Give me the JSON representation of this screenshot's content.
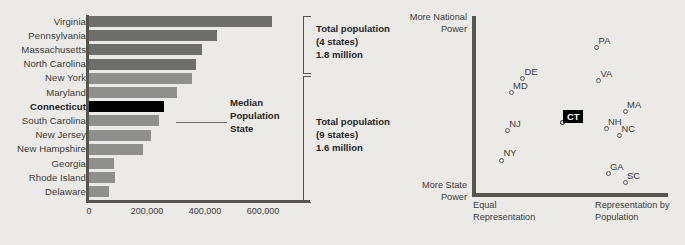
{
  "figure": {
    "background_color": "#eceae7",
    "bar_color_top": "#6e6e6c",
    "bar_color_bottom": "#8f8f8d",
    "highlight_color": "#000000",
    "axis_color": "#55544f"
  },
  "chart_data": [
    {
      "type": "bar",
      "orientation": "horizontal",
      "title": "",
      "xlabel": "",
      "ylabel": "",
      "xlim": [
        0,
        660000
      ],
      "grid": false,
      "categories": [
        "Virginia",
        "Pennsylvania",
        "Massachusetts",
        "North Carolina",
        "New York",
        "Maryland",
        "Connecticut",
        "South Carolina",
        "New Jersey",
        "New Hampshire",
        "Georgia",
        "Rhode Island",
        "Delaware"
      ],
      "values": [
        630000,
        440000,
        390000,
        370000,
        355000,
        305000,
        260000,
        240000,
        215000,
        185000,
        85000,
        88000,
        70000
      ],
      "group": [
        "top4",
        "top4",
        "top4",
        "top4",
        "bottom9",
        "bottom9",
        "bottom9",
        "bottom9",
        "bottom9",
        "bottom9",
        "bottom9",
        "bottom9",
        "bottom9"
      ],
      "highlight": "Connecticut",
      "tick_values": [
        0,
        200000,
        400000,
        600000
      ],
      "tick_labels": [
        "0",
        "200,000",
        "400,000",
        "600,000"
      ],
      "annotations": [
        {
          "name": "median-population-state",
          "lines": [
            "Median",
            "Population",
            "State"
          ],
          "points_to": "Connecticut"
        }
      ],
      "brackets": [
        {
          "name": "top-four-states",
          "covers": [
            "Virginia",
            "Pennsylvania",
            "Massachusetts",
            "North Carolina"
          ],
          "lines": [
            "Total population",
            "(4 states)",
            "1.8 million"
          ]
        },
        {
          "name": "bottom-nine-states",
          "covers": [
            "New York",
            "Maryland",
            "Connecticut",
            "South Carolina",
            "New Jersey",
            "New Hampshire",
            "Georgia",
            "Rhode Island",
            "Delaware"
          ],
          "lines": [
            "Total population",
            "(9 states)",
            "1.6 million"
          ]
        }
      ]
    },
    {
      "type": "scatter",
      "title": "",
      "xlabel_left": "Equal Representation",
      "xlabel_right": "Representation by Population",
      "ylabel_top": "More National Power",
      "ylabel_bottom": "More State Power",
      "xlim": [
        0,
        1
      ],
      "ylim": [
        0,
        1
      ],
      "grid": false,
      "legend": "none",
      "points": [
        {
          "label": "PA",
          "x": 0.64,
          "y": 0.84,
          "label_pos": "above-right"
        },
        {
          "label": "VA",
          "x": 0.65,
          "y": 0.65,
          "label_pos": "above-right"
        },
        {
          "label": "DE",
          "x": 0.25,
          "y": 0.66,
          "label_pos": "above-right"
        },
        {
          "label": "MD",
          "x": 0.19,
          "y": 0.58,
          "label_pos": "above-right"
        },
        {
          "label": "MA",
          "x": 0.79,
          "y": 0.47,
          "label_pos": "above-right"
        },
        {
          "label": "NH",
          "x": 0.69,
          "y": 0.37,
          "label_pos": "above-right"
        },
        {
          "label": "NC",
          "x": 0.76,
          "y": 0.33,
          "label_pos": "above-right"
        },
        {
          "label": "NJ",
          "x": 0.17,
          "y": 0.36,
          "label_pos": "above-right"
        },
        {
          "label": "NY",
          "x": 0.14,
          "y": 0.19,
          "label_pos": "above-right"
        },
        {
          "label": "GA",
          "x": 0.7,
          "y": 0.11,
          "label_pos": "above-right"
        },
        {
          "label": "SC",
          "x": 0.79,
          "y": 0.06,
          "label_pos": "above-right"
        }
      ],
      "highlighted_point": {
        "label": "CT",
        "x": 0.46,
        "y": 0.41,
        "style": "black-chip"
      }
    }
  ],
  "bar_chart": {
    "rows": [
      {
        "state": "Virginia",
        "value": 630000
      },
      {
        "state": "Pennsylvania",
        "value": 440000
      },
      {
        "state": "Massachusetts",
        "value": 390000
      },
      {
        "state": "North Carolina",
        "value": 370000
      },
      {
        "state": "New York",
        "value": 355000
      },
      {
        "state": "Maryland",
        "value": 305000
      },
      {
        "state": "Connecticut",
        "value": 260000
      },
      {
        "state": "South Carolina",
        "value": 240000
      },
      {
        "state": "New Jersey",
        "value": 215000
      },
      {
        "state": "New Hampshire",
        "value": 185000
      },
      {
        "state": "Georgia",
        "value": 85000
      },
      {
        "state": "Rhode Island",
        "value": 88000
      },
      {
        "state": "Delaware",
        "value": 70000
      }
    ],
    "ticks": [
      "0",
      "200,000",
      "400,000",
      "600,000"
    ],
    "median_note": {
      "l1": "Median",
      "l2": "Population",
      "l3": "State"
    },
    "bracket_top": {
      "l1": "Total population",
      "l2": "(4 states)",
      "l3": "1.8 million"
    },
    "bracket_bottom": {
      "l1": "Total population",
      "l2": "(9 states)",
      "l3": "1.6 million"
    }
  },
  "scatter_chart": {
    "axis_top": {
      "l1": "More National",
      "l2": "Power"
    },
    "axis_bottom": {
      "l1": "More State",
      "l2": "Power"
    },
    "axis_left": {
      "l1": "Equal",
      "l2": "Representation"
    },
    "axis_right": {
      "l1": "Representation by",
      "l2": "Population"
    },
    "ct_label": "CT",
    "labels": [
      "PA",
      "VA",
      "DE",
      "MD",
      "MA",
      "NH",
      "NC",
      "NJ",
      "NY",
      "GA",
      "SC"
    ]
  }
}
